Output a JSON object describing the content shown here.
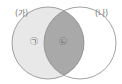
{
  "diagram": {
    "type": "venn",
    "sets": [
      {
        "id": "A",
        "label": "(가)",
        "fill": "#e8e8e8",
        "stroke": "#8a8a8a"
      },
      {
        "id": "B",
        "label": "(나)",
        "fill": "#ffffff",
        "stroke": "#8a8a8a"
      }
    ],
    "regions": [
      {
        "id": "A-only",
        "label": "㉠",
        "fill": "#e8e8e8"
      },
      {
        "id": "A-and-B",
        "label": "㉡",
        "fill": "#a9a9a9"
      }
    ]
  }
}
